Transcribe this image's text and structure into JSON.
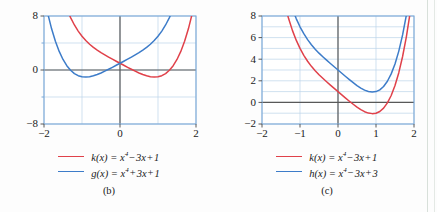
{
  "figure": {
    "background": "#fdfdfd",
    "colors": {
      "red": "#e0414a",
      "blue": "#3d7cc9",
      "grid": "#bcd4ea",
      "axis": "#595959",
      "frame": "#7aa8d8",
      "text": "#1a1a1a"
    }
  },
  "panels": [
    {
      "id": "b",
      "caption": "(b)",
      "chart_data": {
        "type": "line",
        "title": "",
        "xlabel": "",
        "ylabel": "",
        "xlim": [
          -2,
          2
        ],
        "ylim": [
          -8,
          8
        ],
        "grid": true,
        "x_ticks": [
          -2,
          -1,
          0,
          1,
          2
        ],
        "x_tick_labels": [
          "-2",
          "",
          "0",
          "",
          "2"
        ],
        "y_ticks": [
          -8,
          -4,
          0,
          4,
          8
        ],
        "y_tick_labels": [
          "-8",
          "",
          "0",
          "",
          "8"
        ],
        "legend_position": "below",
        "series": [
          {
            "name": "k(x) = x^4 - 3x + 1",
            "color": "#e0414a",
            "expr": "x**4 - 3*x + 1",
            "points": [
              [
                -2.0,
                23.0
              ],
              [
                -1.9,
                19.74
              ],
              [
                -1.8,
                16.9
              ],
              [
                -1.7,
                14.46
              ],
              [
                -1.6,
                12.36
              ],
              [
                -1.5,
                10.56
              ],
              [
                -1.4,
                9.04
              ],
              [
                -1.3,
                7.76
              ],
              [
                -1.2,
                6.67
              ],
              [
                -1.1,
                5.76
              ],
              [
                -1.0,
                5.0
              ],
              [
                -0.9,
                4.36
              ],
              [
                -0.8,
                3.81
              ],
              [
                -0.7,
                3.34
              ],
              [
                -0.6,
                2.93
              ],
              [
                -0.5,
                2.56
              ],
              [
                -0.4,
                2.23
              ],
              [
                -0.3,
                1.91
              ],
              [
                -0.2,
                1.6
              ],
              [
                -0.1,
                1.3
              ],
              [
                0.0,
                1.0
              ],
              [
                0.1,
                0.7
              ],
              [
                0.2,
                0.4
              ],
              [
                0.3,
                0.11
              ],
              [
                0.4,
                -0.17
              ],
              [
                0.5,
                -0.44
              ],
              [
                0.6,
                -0.67
              ],
              [
                0.7,
                -0.86
              ],
              [
                0.8,
                -0.99
              ],
              [
                0.9,
                -1.04
              ],
              [
                1.0,
                -1.0
              ],
              [
                1.1,
                -0.84
              ],
              [
                1.2,
                -0.53
              ],
              [
                1.3,
                -0.04
              ],
              [
                1.4,
                0.64
              ],
              [
                1.5,
                1.56
              ],
              [
                1.6,
                2.75
              ],
              [
                1.7,
                4.25
              ],
              [
                1.8,
                6.1
              ],
              [
                1.9,
                8.34
              ],
              [
                2.0,
                11.0
              ]
            ]
          },
          {
            "name": "g(x) = x^4 + 3x + 1",
            "color": "#3d7cc9",
            "expr": "x**4 + 3*x + 1",
            "points": [
              [
                -2.0,
                11.0
              ],
              [
                -1.9,
                8.34
              ],
              [
                -1.8,
                6.1
              ],
              [
                -1.7,
                4.25
              ],
              [
                -1.6,
                2.75
              ],
              [
                -1.5,
                1.56
              ],
              [
                -1.4,
                0.64
              ],
              [
                -1.3,
                -0.04
              ],
              [
                -1.2,
                -0.53
              ],
              [
                -1.1,
                -0.84
              ],
              [
                -1.0,
                -1.0
              ],
              [
                -0.9,
                -1.04
              ],
              [
                -0.8,
                -0.99
              ],
              [
                -0.7,
                -0.86
              ],
              [
                -0.6,
                -0.67
              ],
              [
                -0.5,
                -0.44
              ],
              [
                -0.4,
                -0.17
              ],
              [
                -0.3,
                0.11
              ],
              [
                -0.2,
                0.4
              ],
              [
                -0.1,
                0.7
              ],
              [
                0.0,
                1.0
              ],
              [
                0.1,
                1.3
              ],
              [
                0.2,
                1.6
              ],
              [
                0.3,
                1.91
              ],
              [
                0.4,
                2.23
              ],
              [
                0.5,
                2.56
              ],
              [
                0.6,
                2.93
              ],
              [
                0.7,
                3.34
              ],
              [
                0.8,
                3.81
              ],
              [
                0.9,
                4.36
              ],
              [
                1.0,
                5.0
              ],
              [
                1.1,
                5.76
              ],
              [
                1.2,
                6.67
              ],
              [
                1.3,
                7.76
              ],
              [
                1.4,
                9.04
              ],
              [
                1.5,
                10.56
              ],
              [
                1.6,
                12.36
              ],
              [
                1.7,
                14.46
              ],
              [
                1.8,
                16.9
              ],
              [
                1.9,
                19.74
              ],
              [
                2.0,
                23.0
              ]
            ]
          }
        ]
      },
      "legend": [
        {
          "color": "#e0414a",
          "fn": "k",
          "var": "x",
          "power": "4",
          "op": "−",
          "term": "3x",
          "op2": "+",
          "const": "1"
        },
        {
          "color": "#3d7cc9",
          "fn": "g",
          "var": "x",
          "power": "4",
          "op": "+",
          "term": "3x",
          "op2": "+",
          "const": "1"
        }
      ]
    },
    {
      "id": "c",
      "caption": "(c)",
      "chart_data": {
        "type": "line",
        "title": "",
        "xlabel": "",
        "ylabel": "",
        "xlim": [
          -2,
          2
        ],
        "ylim": [
          -2,
          8
        ],
        "grid": true,
        "x_ticks": [
          -2,
          -1,
          0,
          1,
          2
        ],
        "x_tick_labels": [
          "-2",
          "-1",
          "0",
          "1",
          "2"
        ],
        "y_ticks": [
          -2,
          0,
          2,
          4,
          6,
          8
        ],
        "y_tick_labels": [
          "-2",
          "0",
          "2",
          "4",
          "6",
          "8"
        ],
        "legend_position": "below",
        "series": [
          {
            "name": "k(x) = x^4 - 3x + 1",
            "color": "#e0414a",
            "expr": "x**4 - 3*x + 1",
            "points": [
              [
                -2.0,
                23.0
              ],
              [
                -1.9,
                19.74
              ],
              [
                -1.8,
                16.9
              ],
              [
                -1.7,
                14.46
              ],
              [
                -1.6,
                12.36
              ],
              [
                -1.5,
                10.56
              ],
              [
                -1.4,
                9.04
              ],
              [
                -1.3,
                7.76
              ],
              [
                -1.2,
                6.67
              ],
              [
                -1.1,
                5.76
              ],
              [
                -1.0,
                5.0
              ],
              [
                -0.9,
                4.36
              ],
              [
                -0.8,
                3.81
              ],
              [
                -0.7,
                3.34
              ],
              [
                -0.6,
                2.93
              ],
              [
                -0.5,
                2.56
              ],
              [
                -0.4,
                2.23
              ],
              [
                -0.3,
                1.91
              ],
              [
                -0.2,
                1.6
              ],
              [
                -0.1,
                1.3
              ],
              [
                0.0,
                1.0
              ],
              [
                0.1,
                0.7
              ],
              [
                0.2,
                0.4
              ],
              [
                0.3,
                0.11
              ],
              [
                0.4,
                -0.17
              ],
              [
                0.5,
                -0.44
              ],
              [
                0.6,
                -0.67
              ],
              [
                0.7,
                -0.86
              ],
              [
                0.8,
                -0.99
              ],
              [
                0.9,
                -1.04
              ],
              [
                1.0,
                -1.0
              ],
              [
                1.1,
                -0.84
              ],
              [
                1.2,
                -0.53
              ],
              [
                1.3,
                -0.04
              ],
              [
                1.4,
                0.64
              ],
              [
                1.5,
                1.56
              ],
              [
                1.6,
                2.75
              ],
              [
                1.7,
                4.25
              ],
              [
                1.8,
                6.1
              ],
              [
                1.9,
                8.34
              ],
              [
                2.0,
                11.0
              ]
            ]
          },
          {
            "name": "h(x) = x^4 - 3x + 3",
            "color": "#3d7cc9",
            "expr": "x**4 - 3*x + 3",
            "points": [
              [
                -2.0,
                25.0
              ],
              [
                -1.9,
                21.74
              ],
              [
                -1.8,
                18.9
              ],
              [
                -1.7,
                16.46
              ],
              [
                -1.6,
                14.36
              ],
              [
                -1.5,
                12.56
              ],
              [
                -1.4,
                11.04
              ],
              [
                -1.3,
                9.76
              ],
              [
                -1.2,
                8.67
              ],
              [
                -1.1,
                7.76
              ],
              [
                -1.0,
                7.0
              ],
              [
                -0.9,
                6.36
              ],
              [
                -0.8,
                5.81
              ],
              [
                -0.7,
                5.34
              ],
              [
                -0.6,
                4.93
              ],
              [
                -0.5,
                4.56
              ],
              [
                -0.4,
                4.23
              ],
              [
                -0.3,
                3.91
              ],
              [
                -0.2,
                3.6
              ],
              [
                -0.1,
                3.3
              ],
              [
                0.0,
                3.0
              ],
              [
                0.1,
                2.7
              ],
              [
                0.2,
                2.4
              ],
              [
                0.3,
                2.11
              ],
              [
                0.4,
                1.83
              ],
              [
                0.5,
                1.56
              ],
              [
                0.6,
                1.33
              ],
              [
                0.7,
                1.14
              ],
              [
                0.8,
                1.01
              ],
              [
                0.9,
                0.96
              ],
              [
                1.0,
                1.0
              ],
              [
                1.1,
                1.16
              ],
              [
                1.2,
                1.47
              ],
              [
                1.3,
                1.96
              ],
              [
                1.4,
                2.64
              ],
              [
                1.5,
                3.56
              ],
              [
                1.6,
                4.75
              ],
              [
                1.7,
                6.25
              ],
              [
                1.8,
                8.1
              ],
              [
                1.9,
                10.34
              ],
              [
                2.0,
                13.0
              ]
            ]
          }
        ]
      },
      "legend": [
        {
          "color": "#e0414a",
          "fn": "k",
          "var": "x",
          "power": "4",
          "op": "−",
          "term": "3x",
          "op2": "+",
          "const": "1"
        },
        {
          "color": "#3d7cc9",
          "fn": "h",
          "var": "x",
          "power": "4",
          "op": "−",
          "term": "3x",
          "op2": "+",
          "const": "3"
        }
      ]
    }
  ]
}
